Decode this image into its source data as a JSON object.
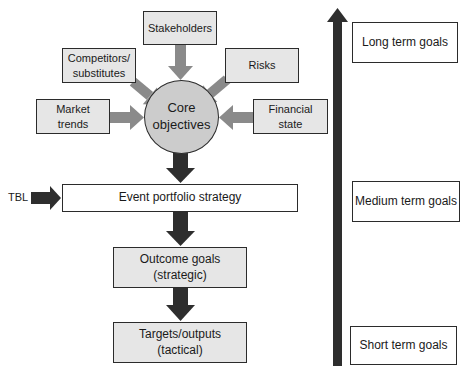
{
  "diagram": {
    "inputs": {
      "stakeholders": "Stakeholders",
      "competitors": "Competitors/\nsubstitutes",
      "risks": "Risks",
      "market_trends": "Market\ntrends",
      "financial_state": "Financial\nstate"
    },
    "core": "Core\nobjectives",
    "tbl": "TBL",
    "strategy": "Event portfolio strategy",
    "outcome": "Outcome goals\n(strategic)",
    "targets": "Targets/outputs\n(tactical)",
    "timeline": {
      "long": "Long term goals",
      "medium": "Medium term goals",
      "short": "Short term goals"
    }
  },
  "colors": {
    "box_fill": "#e6e6e6",
    "circle_fill": "#cccccc",
    "light_arrow": "#8a8a8a",
    "dark_arrow": "#2e2e2e"
  }
}
